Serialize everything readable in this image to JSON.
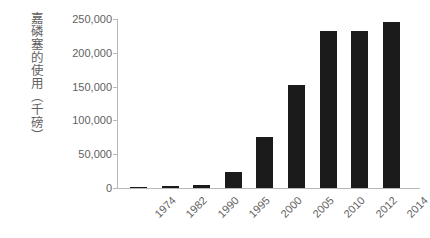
{
  "chart_data": {
    "type": "bar",
    "title": "",
    "subtitle": "",
    "xlabel": "",
    "ylabel": "嘉磷塞的使用（千磅）",
    "categories": [
      "1974",
      "1982",
      "1990",
      "1995",
      "2000",
      "2005",
      "2010",
      "2012",
      "2014"
    ],
    "values": [
      1000,
      2500,
      4000,
      23000,
      76000,
      153000,
      232000,
      232000,
      246000
    ],
    "ylim": [
      0,
      250000
    ],
    "y_ticks": [
      0,
      50000,
      100000,
      150000,
      200000,
      250000
    ],
    "y_tick_labels": [
      "0",
      "50,000",
      "100,000",
      "150,000",
      "200,000",
      "250,000"
    ],
    "grid": false,
    "legend": false,
    "legend_position": "none",
    "bar_color": "#1b1b1b",
    "axis_color": "#b9b9b9",
    "text_color": "#5f5f5f",
    "background_color": "#ffffff",
    "x_tick_rotation": -45
  }
}
